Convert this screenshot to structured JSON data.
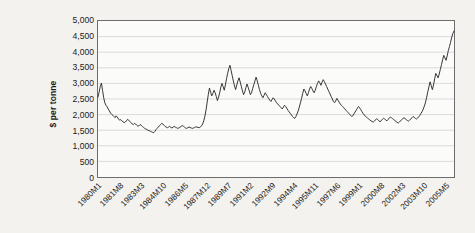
{
  "chart_data": {
    "type": "line",
    "title": "",
    "subtitle": "",
    "xlabel": "",
    "ylabel": "$ per tonne",
    "ylim": [
      0,
      5000
    ],
    "ytick_step": 500,
    "yticks": [
      "0",
      "500",
      "1,000",
      "1,500",
      "2,000",
      "2,500",
      "3,000",
      "3,500",
      "4,000",
      "4,500",
      "5,000"
    ],
    "ytick_values": [
      0,
      500,
      1000,
      1500,
      2000,
      2500,
      3000,
      3500,
      4000,
      4500,
      5000
    ],
    "grid": "horizontal",
    "legend": "none",
    "line_color": "#2b2b2b",
    "plot_background": "#fbfbfa",
    "page_background": "#f4f2ef",
    "border_color": "#6d6d6d",
    "xtick_labels": [
      "1980M1",
      "1981M8",
      "1983M3",
      "1984M10",
      "1986M5",
      "1987M12",
      "1989M7",
      "1991M2",
      "1992M9",
      "1994M4",
      "1995M11",
      "1997M6",
      "1999M1",
      "2000M8",
      "2002M3",
      "2003M10",
      "2005M5"
    ],
    "xtick_indices": [
      0,
      19,
      38,
      57,
      76,
      95,
      114,
      133,
      152,
      171,
      190,
      209,
      228,
      247,
      266,
      285,
      304
    ],
    "x_start": "1980M1",
    "x_end": "2005M12",
    "n_points": 312,
    "values": [
      2560,
      2720,
      2900,
      3010,
      2780,
      2540,
      2380,
      2300,
      2250,
      2180,
      2120,
      2050,
      2010,
      1980,
      1940,
      1900,
      1960,
      1920,
      1860,
      1820,
      1840,
      1800,
      1770,
      1740,
      1760,
      1800,
      1850,
      1820,
      1780,
      1740,
      1700,
      1680,
      1720,
      1700,
      1660,
      1630,
      1640,
      1680,
      1660,
      1620,
      1590,
      1560,
      1540,
      1520,
      1500,
      1480,
      1470,
      1450,
      1430,
      1420,
      1460,
      1520,
      1560,
      1600,
      1640,
      1680,
      1720,
      1700,
      1660,
      1620,
      1600,
      1580,
      1600,
      1620,
      1590,
      1570,
      1600,
      1620,
      1600,
      1580,
      1560,
      1570,
      1590,
      1620,
      1650,
      1630,
      1600,
      1570,
      1560,
      1580,
      1600,
      1590,
      1570,
      1560,
      1570,
      1590,
      1610,
      1600,
      1590,
      1580,
      1600,
      1640,
      1700,
      1800,
      1950,
      2150,
      2400,
      2650,
      2850,
      2720,
      2600,
      2680,
      2780,
      2700,
      2580,
      2450,
      2560,
      2700,
      2880,
      3000,
      2900,
      2780,
      2950,
      3150,
      3320,
      3480,
      3580,
      3420,
      3250,
      3080,
      2920,
      2800,
      2950,
      3080,
      3180,
      3050,
      2900,
      2760,
      2640,
      2720,
      2860,
      2980,
      2880,
      2760,
      2640,
      2700,
      2840,
      2960,
      3080,
      3200,
      3080,
      2940,
      2800,
      2680,
      2600,
      2540,
      2620,
      2700,
      2640,
      2580,
      2520,
      2460,
      2420,
      2480,
      2540,
      2500,
      2440,
      2380,
      2340,
      2300,
      2260,
      2220,
      2180,
      2240,
      2300,
      2260,
      2200,
      2140,
      2090,
      2040,
      1990,
      1940,
      1900,
      1880,
      1940,
      2020,
      2120,
      2240,
      2380,
      2520,
      2680,
      2820,
      2760,
      2680,
      2600,
      2700,
      2820,
      2900,
      2840,
      2760,
      2700,
      2780,
      2900,
      3000,
      3080,
      3020,
      2940,
      3040,
      3120,
      3060,
      2980,
      2900,
      2820,
      2740,
      2660,
      2580,
      2500,
      2420,
      2380,
      2440,
      2520,
      2460,
      2400,
      2340,
      2300,
      2260,
      2220,
      2180,
      2140,
      2100,
      2060,
      2020,
      1980,
      1940,
      1960,
      2020,
      2080,
      2140,
      2200,
      2260,
      2220,
      2160,
      2100,
      2040,
      1990,
      1950,
      1920,
      1890,
      1860,
      1830,
      1800,
      1780,
      1760,
      1790,
      1830,
      1870,
      1840,
      1800,
      1770,
      1800,
      1850,
      1880,
      1860,
      1830,
      1800,
      1840,
      1890,
      1920,
      1900,
      1870,
      1840,
      1810,
      1780,
      1750,
      1730,
      1760,
      1800,
      1840,
      1870,
      1900,
      1870,
      1840,
      1810,
      1790,
      1820,
      1860,
      1900,
      1940,
      1910,
      1880,
      1860,
      1890,
      1930,
      1980,
      2040,
      2100,
      2180,
      2280,
      2400,
      2560,
      2740,
      2900,
      3050,
      2920,
      2800,
      2950,
      3150,
      3320,
      3250,
      3180,
      3300,
      3450,
      3600,
      3760,
      3900,
      3820,
      3740,
      3880,
      4050,
      4180,
      4320,
      4480,
      4600,
      4680
    ],
    "first_value": 2560,
    "max_value": 4680,
    "min_value": 1420,
    "last_value": 4680
  }
}
